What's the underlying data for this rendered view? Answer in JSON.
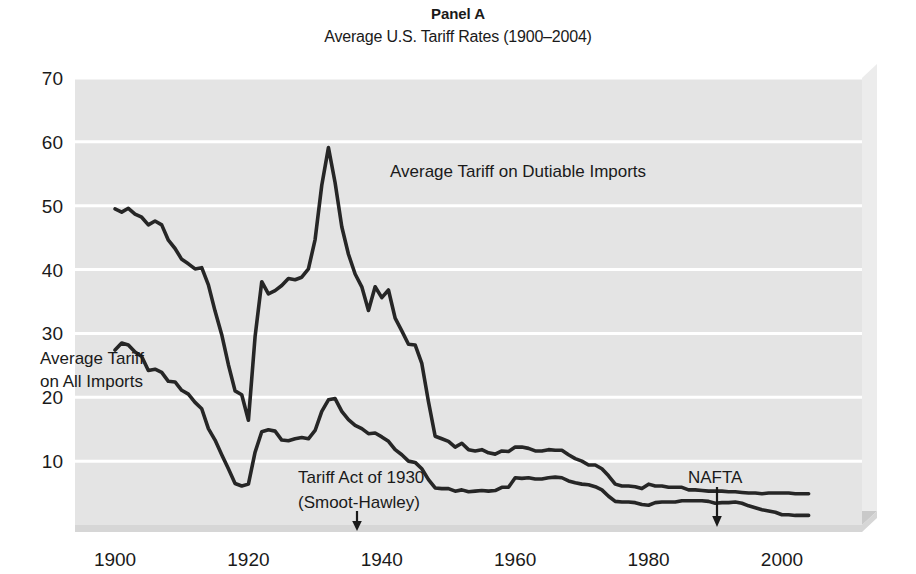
{
  "figure": {
    "panel_label": "Panel A",
    "subtitle": "Average U.S. Tariff Rates (1900–2004)"
  },
  "labels": {
    "series_dutiable": "Average Tariff on Dutiable Imports",
    "series_all_line1": "Average Tariff",
    "series_all_line2": "on All Imports",
    "annot_smoot_line1": "Tariff Act of 1930",
    "annot_smoot_line2": "(Smoot-Hawley)",
    "annot_nafta": "NAFTA"
  },
  "colors": {
    "plot_background": "#e4e4e4",
    "gridline": "#ffffff",
    "line": "#262626",
    "bevel_light": "#f0f0f0",
    "bevel_shadow": "#bdbdbd",
    "text": "#1a1a1a"
  },
  "chart_data": {
    "type": "line",
    "title": "Panel A",
    "subtitle": "Average U.S. Tariff Rates (1900–2004)",
    "xlabel": "",
    "ylabel": "",
    "xlim": [
      1894,
      2012
    ],
    "ylim": [
      0,
      70
    ],
    "xticks": [
      1900,
      1920,
      1940,
      1960,
      1980,
      2000
    ],
    "yticks": [
      10,
      20,
      30,
      40,
      50,
      60,
      70
    ],
    "grid": "horizontal",
    "legend": "inline-labels",
    "annotations": [
      {
        "text": "Tariff Act of 1930 (Smoot-Hawley)",
        "year": 1930,
        "arrow": "down"
      },
      {
        "text": "NAFTA",
        "year": 1993,
        "arrow": "down"
      }
    ],
    "series": [
      {
        "name": "Average Tariff on Dutiable Imports",
        "x": [
          1900,
          1901,
          1902,
          1903,
          1904,
          1905,
          1906,
          1907,
          1908,
          1909,
          1910,
          1911,
          1912,
          1913,
          1914,
          1915,
          1916,
          1917,
          1918,
          1919,
          1920,
          1921,
          1922,
          1923,
          1924,
          1925,
          1926,
          1927,
          1928,
          1929,
          1930,
          1931,
          1932,
          1933,
          1934,
          1935,
          1936,
          1937,
          1938,
          1939,
          1940,
          1941,
          1942,
          1943,
          1944,
          1945,
          1946,
          1947,
          1948,
          1949,
          1950,
          1951,
          1952,
          1953,
          1954,
          1955,
          1956,
          1957,
          1958,
          1959,
          1960,
          1961,
          1962,
          1963,
          1964,
          1965,
          1966,
          1967,
          1968,
          1969,
          1970,
          1971,
          1972,
          1973,
          1974,
          1975,
          1976,
          1977,
          1978,
          1979,
          1980,
          1981,
          1982,
          1983,
          1984,
          1985,
          1986,
          1987,
          1988,
          1989,
          1990,
          1991,
          1992,
          1993,
          1994,
          1995,
          1996,
          1997,
          1998,
          1999,
          2000,
          2001,
          2002,
          2003,
          2004
        ],
        "y": [
          49.5,
          49.0,
          49.6,
          48.7,
          48.2,
          47.0,
          47.6,
          47.0,
          44.6,
          43.3,
          41.6,
          40.9,
          40.1,
          40.3,
          37.6,
          33.5,
          29.8,
          25.1,
          21.0,
          20.4,
          16.4,
          29.5,
          38.1,
          36.2,
          36.7,
          37.5,
          38.6,
          38.4,
          38.8,
          40.1,
          44.7,
          53.2,
          59.1,
          53.6,
          46.7,
          42.4,
          39.3,
          37.3,
          33.6,
          37.3,
          35.6,
          36.8,
          32.4,
          30.4,
          28.3,
          28.2,
          25.3,
          19.3,
          13.9,
          13.5,
          13.1,
          12.2,
          12.8,
          11.8,
          11.6,
          11.8,
          11.3,
          11.1,
          11.6,
          11.5,
          12.2,
          12.2,
          12.0,
          11.6,
          11.6,
          11.8,
          11.7,
          11.7,
          11.0,
          10.4,
          10.0,
          9.4,
          9.4,
          8.8,
          7.7,
          6.4,
          6.1,
          6.1,
          6.0,
          5.7,
          6.4,
          6.1,
          6.1,
          5.9,
          5.9,
          5.9,
          5.5,
          5.5,
          5.4,
          5.3,
          5.3,
          5.3,
          5.2,
          5.2,
          5.1,
          5.0,
          5.0,
          4.9,
          5.0,
          5.0,
          5.0,
          5.0,
          4.9,
          4.9,
          4.9
        ]
      },
      {
        "name": "Average Tariff on All Imports",
        "x": [
          1900,
          1901,
          1902,
          1903,
          1904,
          1905,
          1906,
          1907,
          1908,
          1909,
          1910,
          1911,
          1912,
          1913,
          1914,
          1915,
          1916,
          1917,
          1918,
          1919,
          1920,
          1921,
          1922,
          1923,
          1924,
          1925,
          1926,
          1927,
          1928,
          1929,
          1930,
          1931,
          1932,
          1933,
          1934,
          1935,
          1936,
          1937,
          1938,
          1939,
          1940,
          1941,
          1942,
          1943,
          1944,
          1945,
          1946,
          1947,
          1948,
          1949,
          1950,
          1951,
          1952,
          1953,
          1954,
          1955,
          1956,
          1957,
          1958,
          1959,
          1960,
          1961,
          1962,
          1963,
          1964,
          1965,
          1966,
          1967,
          1968,
          1969,
          1970,
          1971,
          1972,
          1973,
          1974,
          1975,
          1976,
          1977,
          1978,
          1979,
          1980,
          1981,
          1982,
          1983,
          1984,
          1985,
          1986,
          1987,
          1988,
          1989,
          1990,
          1991,
          1992,
          1993,
          1994,
          1995,
          1996,
          1997,
          1998,
          1999,
          2000,
          2001,
          2002,
          2003,
          2004
        ],
        "y": [
          27.4,
          28.5,
          28.2,
          27.1,
          26.4,
          24.2,
          24.4,
          23.9,
          22.5,
          22.4,
          21.1,
          20.5,
          19.2,
          18.2,
          15.1,
          13.3,
          11.0,
          8.8,
          6.5,
          6.1,
          6.4,
          11.4,
          14.6,
          14.9,
          14.7,
          13.3,
          13.2,
          13.5,
          13.7,
          13.5,
          14.8,
          17.8,
          19.6,
          19.8,
          17.8,
          16.5,
          15.6,
          15.1,
          14.3,
          14.4,
          13.8,
          13.1,
          11.8,
          11.0,
          10.0,
          9.8,
          8.8,
          7.1,
          5.8,
          5.7,
          5.7,
          5.3,
          5.5,
          5.2,
          5.3,
          5.4,
          5.3,
          5.4,
          5.9,
          5.9,
          7.4,
          7.3,
          7.4,
          7.2,
          7.2,
          7.4,
          7.5,
          7.4,
          6.9,
          6.6,
          6.4,
          6.3,
          6.0,
          5.5,
          4.5,
          3.7,
          3.6,
          3.6,
          3.5,
          3.2,
          3.1,
          3.5,
          3.6,
          3.6,
          3.6,
          3.8,
          3.8,
          3.8,
          3.8,
          3.7,
          3.4,
          3.5,
          3.5,
          3.6,
          3.4,
          3.0,
          2.7,
          2.4,
          2.2,
          2.0,
          1.6,
          1.6,
          1.5,
          1.5,
          1.5
        ]
      }
    ]
  }
}
